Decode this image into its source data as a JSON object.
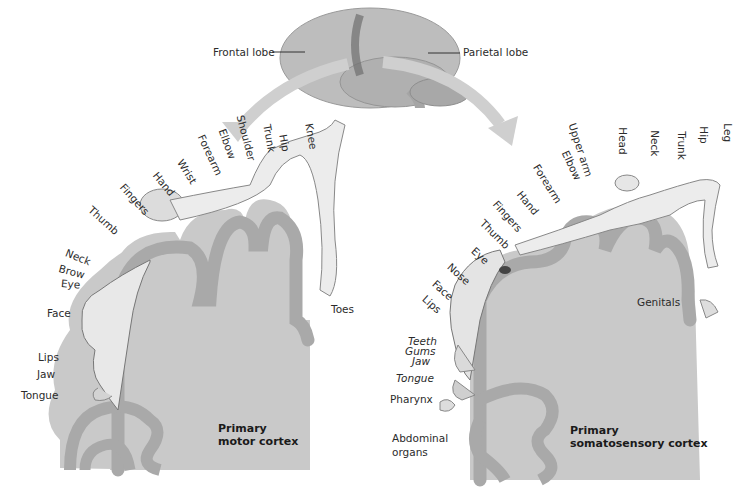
{
  "brain": {
    "frontal_label": "Frontal lobe",
    "parietal_label": "Parietal lobe"
  },
  "motor": {
    "title_line1": "Primary",
    "title_line2": "motor cortex",
    "labels": [
      "Toes",
      "Knee",
      "Hip",
      "Trunk",
      "Shoulder",
      "Elbow",
      "Forearm",
      "Wrist",
      "Hand",
      "Fingers",
      "Thumb",
      "Neck",
      "Brow",
      "Eye",
      "Face",
      "Lips",
      "Jaw",
      "Tongue"
    ]
  },
  "sensory": {
    "title_line1": "Primary",
    "title_line2": "somatosensory cortex",
    "labels": [
      "Leg",
      "Hip",
      "Trunk",
      "Neck",
      "Head",
      "Upper arm",
      "Elbow",
      "Forearm",
      "Hand",
      "Fingers",
      "Thumb",
      "Eye",
      "Nose",
      "Face",
      "Lips",
      "Genitals",
      "Teeth",
      "Gums",
      "Jaw",
      "Tongue",
      "Pharynx",
      "Abdominal",
      "organs"
    ]
  },
  "colors": {
    "cortex_fill": "#c9c9c9",
    "gyrus_band": "#a9a9a9",
    "arrow": "#cfcfcf",
    "skin": "#e8e8e8"
  }
}
